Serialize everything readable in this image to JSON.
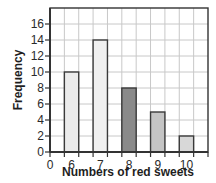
{
  "chart_data": {
    "type": "bar",
    "title": "",
    "xlabel": "Numbers of red sweets",
    "ylabel": "Frequency",
    "categories": [
      "6",
      "7",
      "8",
      "9",
      "10"
    ],
    "values": [
      10,
      14,
      8,
      5,
      2
    ],
    "x_tick_labels": [
      "0",
      "6",
      "7",
      "8",
      "9",
      "10"
    ],
    "y_tick_labels": [
      "0",
      "2",
      "4",
      "6",
      "8",
      "10",
      "12",
      "14",
      "16"
    ],
    "ylim": [
      0,
      18
    ],
    "y_tick_step": 2,
    "grid": true,
    "legend": "none",
    "bar_colors": [
      "#ebebeb",
      "#f0f0f0",
      "#8a8a8a",
      "#c4c4c4",
      "#d8d8d8"
    ],
    "grid_color": "#c8c8c8",
    "axis_color": "#333333",
    "bar_edge_color": "#3a3a3a"
  }
}
